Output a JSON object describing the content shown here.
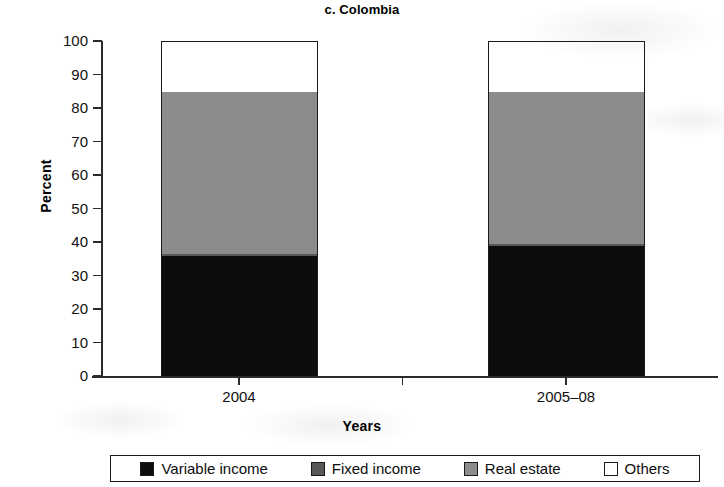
{
  "chart_data": {
    "type": "bar",
    "subtype": "stacked-100",
    "title": "c. Colombia",
    "xlabel": "Years",
    "ylabel": "Percent",
    "categories": [
      "2004",
      "2005–08"
    ],
    "ylim": [
      0,
      100
    ],
    "yticks": [
      0,
      10,
      20,
      30,
      40,
      50,
      60,
      70,
      80,
      90,
      100
    ],
    "ytick_labels": [
      "0",
      "10",
      "20",
      "30",
      "40",
      "50",
      "60",
      "70",
      "80",
      "90",
      "100"
    ],
    "grid": false,
    "legend_position": "bottom",
    "series": [
      {
        "name": "Variable income",
        "color": "#0d0d0d",
        "values": [
          36,
          39
        ]
      },
      {
        "name": "Fixed income",
        "color": "#585858",
        "values": [
          0.5,
          0.5
        ]
      },
      {
        "name": "Real estate",
        "color": "#8c8c8c",
        "values": [
          48.5,
          45.5
        ]
      },
      {
        "name": "Others",
        "color": "#ffffff",
        "values": [
          15,
          15
        ]
      }
    ]
  }
}
